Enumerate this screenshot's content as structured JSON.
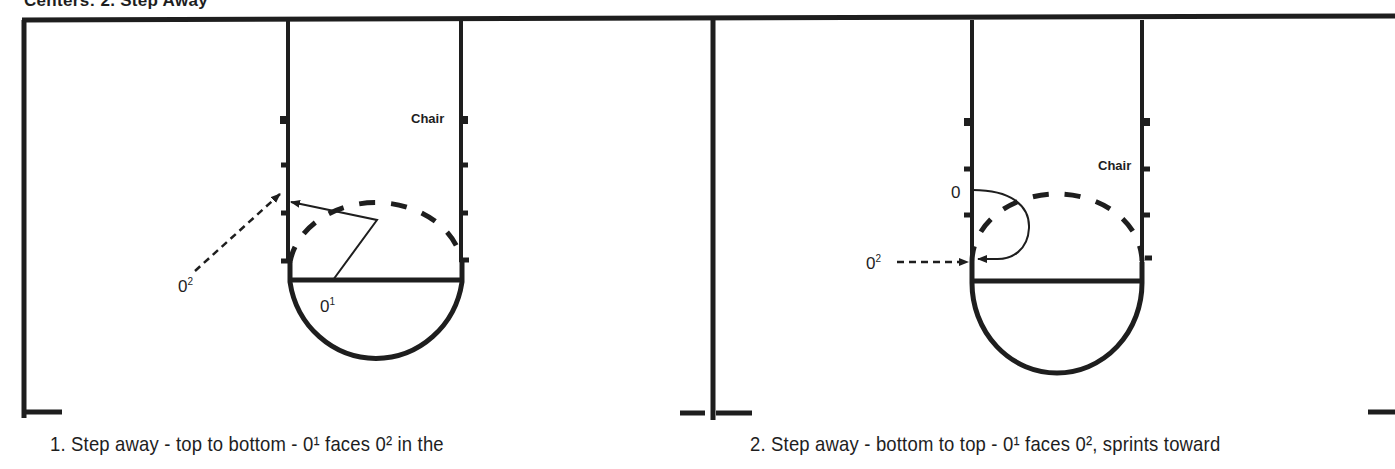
{
  "title": "Centers: 2. Step Away",
  "diagrams": [
    {
      "id": 1,
      "caption": "1. Step away - top to bottom - 0¹ faces 0² in the",
      "labels": {
        "chair": "Chair",
        "player1": "0",
        "player1_sup": "1",
        "player2": "0",
        "player2_sup": "2"
      }
    },
    {
      "id": 2,
      "caption": "2. Step away - bottom to top - 0¹ faces 0², sprints toward",
      "labels": {
        "chair": "Chair",
        "player1": "0",
        "player1_sup": "",
        "player2": "0",
        "player2_sup": "2"
      }
    }
  ],
  "colors": {
    "ink": "#1e1e1e",
    "background": "#ffffff"
  }
}
